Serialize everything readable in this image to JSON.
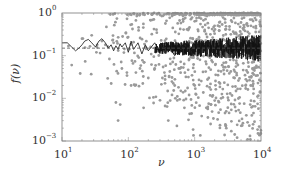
{
  "chart_data": {
    "type": "scatter",
    "title": "",
    "xlabel": "ν",
    "ylabel": "f(ν)",
    "xscale": "log",
    "yscale": "log",
    "xlim": [
      10,
      10000
    ],
    "ylim": [
      0.001,
      1
    ],
    "x_ticks": [
      {
        "value": 10,
        "base": "10",
        "exp": "1"
      },
      {
        "value": 100,
        "base": "10",
        "exp": "2"
      },
      {
        "value": 1000,
        "base": "10",
        "exp": "3"
      },
      {
        "value": 10000,
        "base": "10",
        "exp": "4"
      }
    ],
    "y_ticks": [
      {
        "value": 1,
        "base": "10",
        "exp": "0"
      },
      {
        "value": 0.1,
        "base": "10",
        "exp": "−1"
      },
      {
        "value": 0.01,
        "base": "10",
        "exp": "−2"
      },
      {
        "value": 0.001,
        "base": "10",
        "exp": "−3"
      }
    ],
    "grid": false,
    "legend": null,
    "reference_line": {
      "style": "dashed",
      "y": 0.15,
      "color": "#555555"
    },
    "series": [
      {
        "name": "scatter points",
        "kind": "scatter",
        "color": "#9a9a9a",
        "description": "Gray dots; sparse near ν=10–100 clustered around 0.1–0.3, density increasing with ν, spreading from ~0.001 to ~1 by ν≈10^3–10^4",
        "points": [
          [
            14,
            0.06
          ],
          [
            20,
            0.25
          ],
          [
            28,
            0.3
          ],
          [
            33,
            0.12
          ],
          [
            40,
            0.22
          ],
          [
            45,
            0.18
          ],
          [
            60,
            0.2
          ],
          [
            65,
            0.008
          ],
          [
            70,
            0.003
          ],
          [
            80,
            0.05
          ],
          [
            95,
            0.04
          ],
          [
            110,
            0.02
          ],
          [
            130,
            0.04
          ],
          [
            150,
            0.05
          ],
          [
            170,
            0.006
          ],
          [
            200,
            0.03
          ],
          [
            250,
            0.05
          ],
          [
            300,
            0.009
          ],
          [
            350,
            0.04
          ],
          [
            400,
            0.003
          ],
          [
            500,
            0.02
          ],
          [
            600,
            0.05
          ],
          [
            700,
            0.006
          ],
          [
            800,
            0.4
          ],
          [
            1000,
            0.02
          ],
          [
            1200,
            0.08
          ],
          [
            1500,
            0.006
          ],
          [
            2000,
            0.5
          ],
          [
            2500,
            0.01
          ],
          [
            3000,
            0.002
          ],
          [
            4000,
            0.03
          ],
          [
            5000,
            0.6
          ],
          [
            6000,
            0.004
          ],
          [
            7000,
            0.02
          ],
          [
            8000,
            0.05
          ],
          [
            9000,
            0.0015
          ]
        ]
      },
      {
        "name": "running estimate",
        "kind": "line",
        "color": "#111111",
        "description": "Black jagged line starting near 0.2 at ν=10, fluctuating around 0.12–0.25, increasingly dense oscillation for ν>300",
        "points": [
          [
            10,
            0.2
          ],
          [
            12,
            0.2
          ],
          [
            14,
            0.16
          ],
          [
            16,
            0.13
          ],
          [
            18,
            0.15
          ],
          [
            20,
            0.18
          ],
          [
            22,
            0.22
          ],
          [
            25,
            0.24
          ],
          [
            28,
            0.2
          ],
          [
            32,
            0.16
          ],
          [
            36,
            0.22
          ],
          [
            40,
            0.25
          ],
          [
            45,
            0.2
          ],
          [
            50,
            0.15
          ],
          [
            55,
            0.18
          ],
          [
            60,
            0.13
          ],
          [
            65,
            0.17
          ],
          [
            70,
            0.14
          ],
          [
            75,
            0.19
          ],
          [
            80,
            0.16
          ],
          [
            90,
            0.2
          ],
          [
            100,
            0.12
          ],
          [
            110,
            0.22
          ],
          [
            120,
            0.14
          ],
          [
            140,
            0.2
          ],
          [
            160,
            0.11
          ],
          [
            180,
            0.18
          ],
          [
            200,
            0.13
          ],
          [
            250,
            0.2
          ],
          [
            300,
            0.12
          ],
          [
            400,
            0.19
          ],
          [
            500,
            0.1
          ],
          [
            700,
            0.2
          ],
          [
            1000,
            0.11
          ],
          [
            1500,
            0.21
          ],
          [
            2000,
            0.1
          ],
          [
            3000,
            0.2
          ],
          [
            5000,
            0.11
          ],
          [
            7000,
            0.2
          ],
          [
            10000,
            0.14
          ]
        ]
      }
    ]
  },
  "labels": {
    "xlabel": "ν",
    "ylabel": "f(ν)"
  }
}
